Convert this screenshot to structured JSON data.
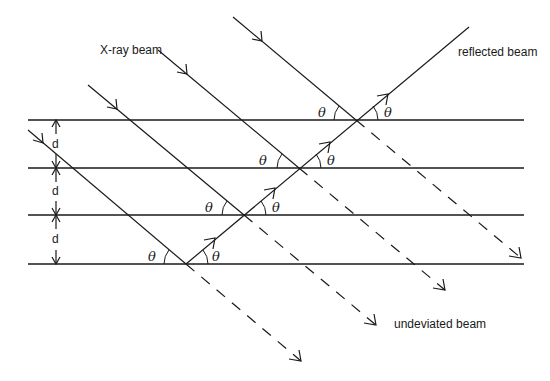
{
  "diagram": {
    "labels": {
      "incident": "X-ray beam",
      "reflected": "reflected beam",
      "undeviated": "undeviated beam",
      "spacing": "d",
      "angle": "θ"
    },
    "planes": {
      "count": 4,
      "y": [
        120,
        168,
        215,
        264
      ],
      "x_start": 28,
      "x_end": 524
    },
    "incident_beams": [
      {
        "start": [
          233,
          17
        ],
        "hit": [
          356,
          120
        ],
        "end": [
          521,
          258
        ]
      },
      {
        "start": [
          158,
          50
        ],
        "hit": [
          299,
          168
        ],
        "end": [
          445,
          290
        ]
      },
      {
        "start": [
          88,
          85
        ],
        "hit": [
          244,
          215
        ],
        "end": [
          376,
          325
        ]
      },
      {
        "start": [
          28,
          130
        ],
        "hit": [
          186,
          264
        ],
        "end": [
          301,
          361
        ]
      }
    ],
    "reflected_beam": {
      "start": [
        186,
        264
      ],
      "end": [
        469,
        27
      ]
    },
    "spacing_markers": [
      "d",
      "d",
      "d"
    ],
    "angle_markers": [
      "θ",
      "θ",
      "θ",
      "θ",
      "θ",
      "θ",
      "θ",
      "θ"
    ],
    "colors": {
      "ink": "#1a1a1a",
      "background": "#ffffff"
    }
  }
}
